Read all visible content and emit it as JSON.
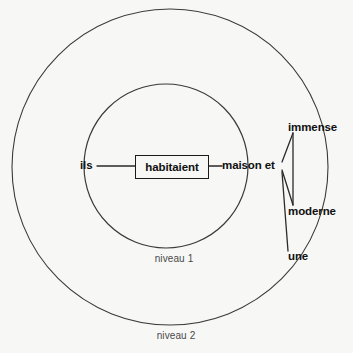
{
  "diagram": {
    "background_color": "#f7f7f6",
    "line_color": "#3a3a3a",
    "text_color": "#101010",
    "ring_label_color": "#4a4a4a",
    "rings": [
      {
        "label": "niveau 1",
        "cx": 166,
        "cy": 166,
        "r": 82,
        "label_x": 174,
        "label_y": 254
      },
      {
        "label": "niveau 2",
        "cx": 170,
        "cy": 167,
        "r": 158,
        "label_x": 176,
        "label_y": 331
      }
    ],
    "nodes": [
      {
        "id": "ils",
        "label": "ils",
        "x": 80,
        "y": 166,
        "anchor": "left",
        "boxed": false
      },
      {
        "id": "habitaient",
        "label": "habitaient",
        "x": 135,
        "y": 155,
        "w": 74,
        "h": 24,
        "boxed": true
      },
      {
        "id": "maison_et",
        "label": "maison et",
        "x": 222,
        "y": 166,
        "anchor": "left",
        "boxed": false
      },
      {
        "id": "immense",
        "label": "immense",
        "x": 288,
        "y": 128,
        "anchor": "left",
        "boxed": false
      },
      {
        "id": "moderne",
        "label": "moderne",
        "x": 288,
        "y": 212,
        "anchor": "left",
        "boxed": false
      },
      {
        "id": "une",
        "label": "une",
        "x": 288,
        "y": 257,
        "anchor": "left",
        "boxed": false
      }
    ],
    "edges": [
      {
        "from": "ils",
        "to": "habitaient",
        "x1": 97,
        "y1": 166,
        "x2": 135,
        "y2": 166
      },
      {
        "from": "habitaient",
        "to": "maison_et",
        "x1": 209,
        "y1": 166,
        "x2": 222,
        "y2": 166
      },
      {
        "from": "maison_et",
        "to": "immense",
        "x1": 282,
        "y1": 162,
        "x2": 293,
        "y2": 133
      },
      {
        "from": "maison_et",
        "to": "moderne",
        "x1": 282,
        "y1": 170,
        "x2": 293,
        "y2": 205
      },
      {
        "from": "maison_et",
        "to": "une",
        "x1": 282,
        "y1": 172,
        "x2": 288,
        "y2": 251
      },
      {
        "from": "immense",
        "to": "moderne",
        "x1": 293,
        "y1": 133,
        "x2": 293,
        "y2": 205
      }
    ]
  }
}
